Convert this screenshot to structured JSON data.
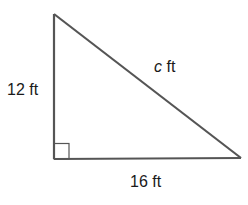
{
  "diagram": {
    "type": "right-triangle",
    "colors": {
      "stroke": "#555555",
      "text": "#1a1a1a",
      "background": "#ffffff"
    },
    "vertices": {
      "top": [
        54,
        14
      ],
      "right_angle": [
        54,
        159
      ],
      "right": [
        241,
        158
      ]
    },
    "right_angle_marker": true,
    "labels": {
      "vertical_leg": "12 ft",
      "horizontal_leg": "16 ft",
      "hypotenuse_var": "c",
      "hypotenuse_unit": " ft"
    }
  }
}
